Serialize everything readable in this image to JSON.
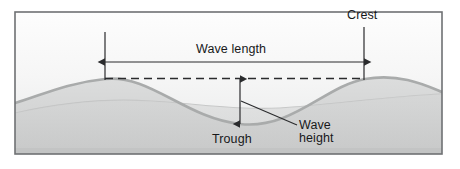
{
  "figure": {
    "type": "ocean-wave-anatomy-diagram",
    "frame": {
      "x": 14,
      "y": 11,
      "width": 429,
      "height": 144,
      "border_color": "#6f7173"
    },
    "background": {
      "sky_top_color": "#fdfdfd",
      "sky_bottom_color": "#e9eaea",
      "water_fill_color": "#d2d3d3",
      "deep_fill_color": "#c9caca"
    },
    "labels": {
      "crest": "Crest",
      "wave_length": "Wave length",
      "trough": "Trough",
      "wave_height_line1": "Wave",
      "wave_height_line2": "height"
    },
    "annotation_color": "#2a2b2d",
    "wave_stroke_color": "#a9abab",
    "wave_secondary_color": "#c2c3c3",
    "measurements": {
      "wavelength_arrow_y": 62,
      "wavelength_arrow_x_start": 105,
      "wavelength_arrow_x_end": 364,
      "crest_guide_x_left": 105,
      "crest_guide_x_right": 364,
      "crest_level_y": 79,
      "trough_level_y": 124,
      "wave_height_arrow_x": 240
    }
  }
}
